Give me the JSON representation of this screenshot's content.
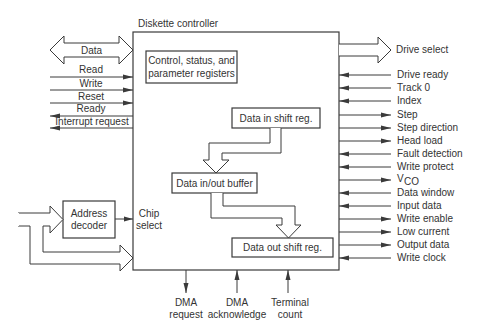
{
  "title": "Diskette controller",
  "blocks": {
    "control_line1": "Control, status, and",
    "control_line2": "parameter registers",
    "data_in_shift": "Data in shift reg.",
    "data_buffer": "Data in/out buffer",
    "data_out_shift": "Data out shift reg.",
    "address_line1": "Address",
    "address_line2": "decoder"
  },
  "left_signals": {
    "data": "Data",
    "items": [
      "Read",
      "Write",
      "Reset",
      "Ready",
      "Interrupt request"
    ],
    "chip_select_line1": "Chip",
    "chip_select_line2": "select"
  },
  "right_signals": {
    "drive_select": "Drive select",
    "items": [
      "Drive ready",
      "Track 0",
      "Index",
      "Step",
      "Step direction",
      "Head load",
      "Fault detection",
      "Write protect",
      "V",
      "Data window",
      "Input data",
      "Write enable",
      "Low current",
      "Output data",
      "Write clock"
    ],
    "vco_subscript": "CO",
    "directions": [
      "in",
      "in",
      "in",
      "out",
      "out",
      "out",
      "in",
      "in",
      "out",
      "in",
      "in",
      "out",
      "out",
      "out",
      "in"
    ]
  },
  "bottom_signals": [
    {
      "line1": "DMA",
      "line2": "request",
      "direction": "out"
    },
    {
      "line1": "DMA",
      "line2": "acknowledge",
      "direction": "in"
    },
    {
      "line1": "Terminal",
      "line2": "count",
      "direction": "in"
    }
  ]
}
